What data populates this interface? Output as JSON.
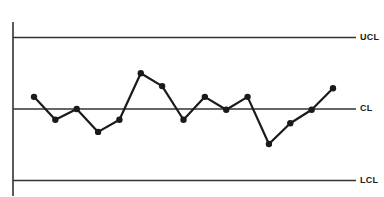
{
  "chart_data": {
    "type": "line",
    "title": "",
    "xlabel": "",
    "ylabel": "",
    "grid": false,
    "legend": "none",
    "control_limits": {
      "UCL": 1.0,
      "CL": 0.0,
      "LCL": -1.0
    },
    "labels": {
      "ucl": "UCL",
      "cl": "CL",
      "lcl": "LCL"
    },
    "x": [
      1,
      2,
      3,
      4,
      5,
      6,
      7,
      8,
      9,
      10,
      11,
      12,
      13,
      14,
      15
    ],
    "values": [
      0.17,
      -0.15,
      0.0,
      -0.32,
      -0.15,
      0.5,
      0.32,
      -0.15,
      0.17,
      -0.01,
      0.17,
      -0.49,
      -0.2,
      -0.01,
      0.29
    ],
    "ylim": [
      -1.2,
      1.2
    ]
  },
  "colors": {
    "line": "#1a1a1a",
    "limit_line": "#333333",
    "background": "#ffffff"
  }
}
